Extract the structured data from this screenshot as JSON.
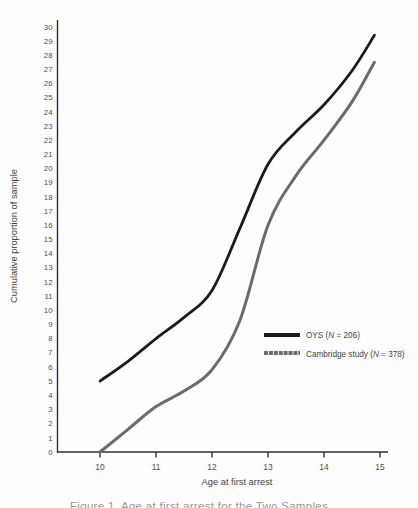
{
  "chart_data": {
    "type": "line",
    "title": "",
    "xlabel": "Age at first arrest",
    "ylabel": "Cumulative proportion of sample",
    "x": [
      10,
      10.5,
      11,
      11.5,
      12,
      12.5,
      13,
      13.5,
      14,
      14.5,
      14.9
    ],
    "xlim": [
      10,
      15
    ],
    "ylim": [
      0,
      30
    ],
    "x_ticks": [
      10,
      11,
      12,
      13,
      14,
      15
    ],
    "y_ticks": [
      0,
      1,
      2,
      3,
      4,
      5,
      6,
      7,
      8,
      9,
      10,
      11,
      12,
      13,
      14,
      15,
      16,
      17,
      18,
      19,
      20,
      21,
      22,
      23,
      24,
      25,
      26,
      27,
      28,
      29,
      30
    ],
    "grid": false,
    "legend_position": "middle-right",
    "series": [
      {
        "id": "oys",
        "name": "OYS (N = 206)",
        "label_prefix": "OYS (",
        "label_n": "N",
        "label_suffix": " = 206)",
        "color": "#1b1b1b",
        "width": 2.8,
        "values": [
          5.0,
          6.4,
          8.0,
          9.5,
          11.4,
          15.8,
          20.3,
          22.6,
          24.5,
          26.9,
          29.4
        ]
      },
      {
        "id": "cambridge",
        "name": "Cambridge study (N = 378)",
        "label_prefix": "Cambridge study (",
        "label_n": "N",
        "label_suffix": " = 378)",
        "color": "#6b6b6b",
        "width": 3.0,
        "values": [
          0,
          1.6,
          3.2,
          4.3,
          5.8,
          9.3,
          16.0,
          19.5,
          22.0,
          24.7,
          27.5
        ]
      }
    ]
  },
  "caption": {
    "cropped_text": "Figure 1.  Age at first arrest for the Two Samples"
  }
}
